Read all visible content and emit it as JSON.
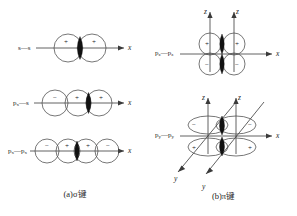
{
  "figure": {
    "background": "#ffffff",
    "ink": "#1d1d1d",
    "orbital_outline_color": "#4a4a4a",
    "overlap_fill_color": "#111111"
  },
  "panel_a": {
    "caption": "(a)σ键",
    "rows": [
      {
        "label_main": "s",
        "label_dash": "—",
        "label_second": "s",
        "axis_label": "x",
        "lobes": [
          {
            "sign": "+"
          },
          {
            "sign": "+"
          }
        ],
        "overlap": "lens"
      },
      {
        "label_main": "p",
        "label_sub": "x",
        "label_dash": "—",
        "label_second": "s",
        "axis_label": "x",
        "lobes": [
          {
            "sign": "−"
          },
          {
            "sign": "+"
          },
          {
            "sign": "+"
          }
        ],
        "overlap": "lens"
      },
      {
        "label_main": "p",
        "label_sub": "x",
        "label_dash": "—",
        "label_second": "p",
        "label_second_sub": "x",
        "axis_label": "x",
        "lobes": [
          {
            "sign": "−"
          },
          {
            "sign": "+"
          },
          {
            "sign": "+"
          },
          {
            "sign": "−"
          }
        ],
        "overlap": "lens"
      }
    ]
  },
  "panel_b": {
    "caption": "(b)π键",
    "rows": [
      {
        "label_main": "p",
        "label_sub": "z",
        "label_dash": "—",
        "label_second": "p",
        "label_second_sub": "z",
        "axes": [
          {
            "name": "z",
            "label": "z"
          },
          {
            "name": "z",
            "label": "z"
          },
          {
            "name": "x",
            "label": "x"
          }
        ],
        "lobes": [
          {
            "sign": "+",
            "position": "top-left"
          },
          {
            "sign": "+",
            "position": "top-right"
          },
          {
            "sign": "−",
            "position": "bottom-left"
          },
          {
            "sign": "−",
            "position": "bottom-right"
          }
        ],
        "overlaps": [
          "top-lens",
          "bottom-lens"
        ]
      },
      {
        "label_main": "p",
        "label_sub": "y",
        "label_dash": "—",
        "label_second": "p",
        "label_second_sub": "y",
        "axes": [
          {
            "name": "z",
            "label": "z"
          },
          {
            "name": "z",
            "label": "z"
          },
          {
            "name": "x",
            "label": "x"
          },
          {
            "name": "y",
            "label": "y"
          },
          {
            "name": "y",
            "label": "y"
          }
        ],
        "lobes": [
          {
            "sign": "−",
            "position": "top-left"
          },
          {
            "sign": "−",
            "position": "top-right"
          },
          {
            "sign": "+",
            "position": "bottom-left"
          },
          {
            "sign": "+",
            "position": "bottom-right"
          }
        ],
        "overlaps": [
          "top-lens",
          "bottom-lens"
        ]
      }
    ]
  }
}
